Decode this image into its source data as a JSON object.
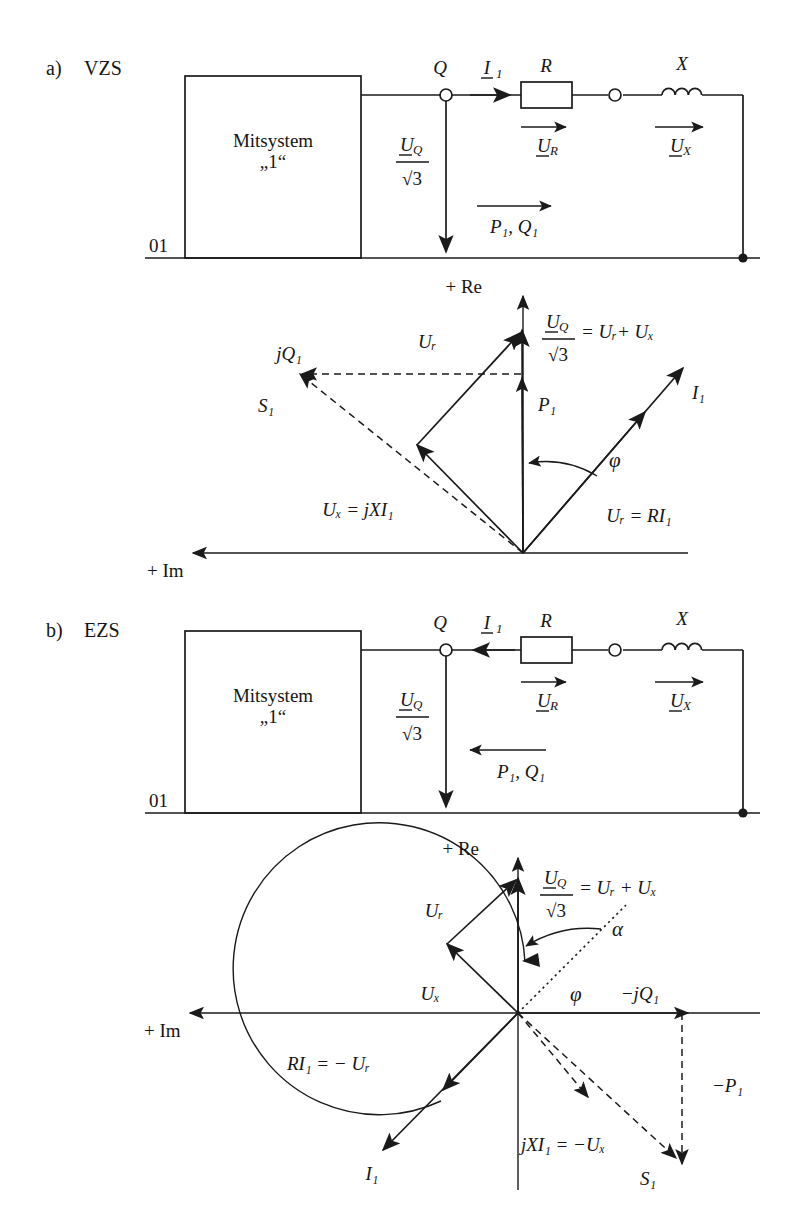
{
  "figure": {
    "sections": [
      {
        "id": "a",
        "marker": "a)",
        "title": "VZS",
        "block_label_line1": "Mitsystem",
        "block_label_line2": "„1“",
        "ground_label": "01",
        "circuit": {
          "node_q": "Q",
          "current": "I",
          "current_sub": "1",
          "resistor": "R",
          "reactance": "X",
          "u_r": "U",
          "u_r_sub": "R",
          "u_x": "U",
          "u_x_sub": "X",
          "uq_num": "U",
          "uq_num_sub": "Q",
          "uq_den": "√3",
          "power_flow": "P₁, Q₁",
          "current_direction": "right",
          "power_direction": "right"
        },
        "phasor": {
          "axis_re": "+ Re",
          "axis_im": "+ Im",
          "angle": "φ",
          "eq_uq": "= Uᵣ+ Uₓ",
          "label_ur": "Uᵣ",
          "label_p1": "P₁",
          "label_jq1": "jQ₁",
          "label_s1": "S₁",
          "label_i1": "I₁",
          "eq_ux": "Uₓ = jXI₁",
          "eq_ur": "Uᵣ = RI₁"
        }
      },
      {
        "id": "b",
        "marker": "b)",
        "title": "EZS",
        "block_label_line1": "Mitsystem",
        "block_label_line2": "„1“",
        "ground_label": "01",
        "circuit": {
          "node_q": "Q",
          "current": "I",
          "current_sub": "1",
          "resistor": "R",
          "reactance": "X",
          "u_r": "U",
          "u_r_sub": "R",
          "u_x": "U",
          "u_x_sub": "X",
          "uq_num": "U",
          "uq_num_sub": "Q",
          "uq_den": "√3",
          "power_flow": "P₁, Q₁",
          "current_direction": "left",
          "power_direction": "left"
        },
        "phasor": {
          "axis_re": "+ Re",
          "axis_im": "+ Im",
          "angle_alpha": "α",
          "angle_phi": "φ",
          "eq_uq": "= Uᵣ + Uₓ",
          "label_ur": "Uᵣ",
          "label_ux": "Uₓ",
          "label_mjq1": "−jQ₁",
          "label_mp1": "−P₁",
          "label_s1": "S₁",
          "label_i1": "I₁",
          "eq_ri1": "RI₁ = − Uᵣ",
          "eq_jxi1": "jXI₁ = −Uₓ"
        }
      }
    ]
  },
  "colors": {
    "ink": "#1a1a1a",
    "paper": "#ffffff"
  }
}
